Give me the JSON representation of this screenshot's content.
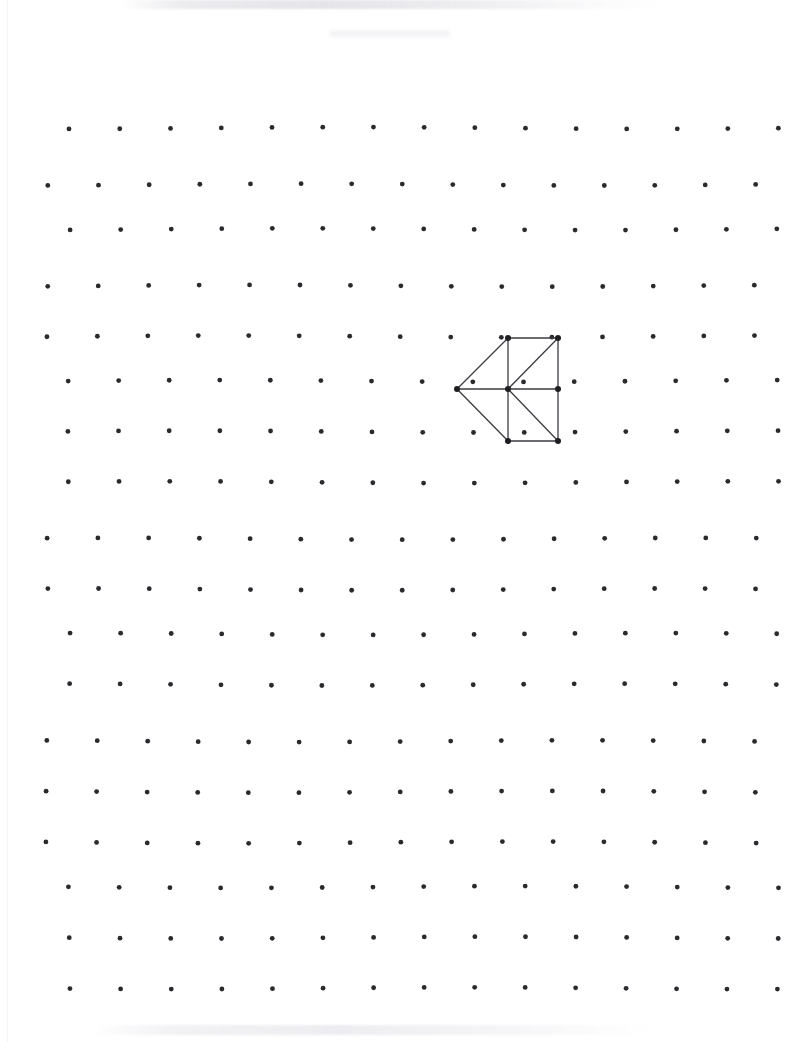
{
  "page": {
    "width": 787,
    "height": 1042,
    "background_color": "#ffffff",
    "medium": "scanned paper"
  },
  "grid": {
    "name": "dot-grid",
    "dot_color": "#2a2a2e",
    "dot_radius": 2.4,
    "columns": 15,
    "rows": 19,
    "spacing_x": 50.6,
    "spacing_y": 50.6,
    "origin_x": 47,
    "origin_y": 134,
    "skew_note": "scan wave distortion: alternating rows shift slightly right/up"
  },
  "figure": {
    "name": "arrowhead-polygon",
    "stroke_color": "#3c3c42",
    "stroke_width": 1.3,
    "vertex_color": "#1e1e22",
    "vertex_radius": 3.0,
    "grid_units": {
      "apex": [
        6,
        3.5
      ],
      "center": [
        7,
        3.5
      ],
      "top_left": [
        7,
        2.5
      ],
      "top_right": [
        8,
        2.5
      ],
      "mid_right": [
        8,
        3.5
      ],
      "bottom_left": [
        7,
        4.5
      ],
      "bottom_right": [
        8,
        4.5
      ]
    },
    "vertices": [
      {
        "id": "apex",
        "label": "A",
        "x": 457,
        "y": 389
      },
      {
        "id": "top_left",
        "label": "B",
        "x": 508,
        "y": 338
      },
      {
        "id": "top_right",
        "label": "C",
        "x": 558,
        "y": 338
      },
      {
        "id": "center",
        "label": "D",
        "x": 508,
        "y": 389
      },
      {
        "id": "mid_right",
        "label": "E",
        "x": 558,
        "y": 389
      },
      {
        "id": "bottom_left",
        "label": "F",
        "x": 508,
        "y": 441
      },
      {
        "id": "bottom_right",
        "label": "G",
        "x": 558,
        "y": 441
      }
    ],
    "edges": [
      {
        "from": "apex",
        "to": "top_left",
        "kind": "diagonal"
      },
      {
        "from": "apex",
        "to": "center",
        "kind": "horizontal"
      },
      {
        "from": "apex",
        "to": "bottom_left",
        "kind": "diagonal"
      },
      {
        "from": "top_left",
        "to": "top_right",
        "kind": "horizontal"
      },
      {
        "from": "top_left",
        "to": "center",
        "kind": "vertical"
      },
      {
        "from": "top_right",
        "to": "mid_right",
        "kind": "vertical"
      },
      {
        "from": "top_right",
        "to": "center",
        "kind": "diagonal"
      },
      {
        "from": "center",
        "to": "mid_right",
        "kind": "horizontal"
      },
      {
        "from": "center",
        "to": "bottom_left",
        "kind": "vertical"
      },
      {
        "from": "center",
        "to": "bottom_right",
        "kind": "diagonal"
      },
      {
        "from": "bottom_left",
        "to": "bottom_right",
        "kind": "horizontal"
      },
      {
        "from": "mid_right",
        "to": "bottom_right",
        "kind": "vertical"
      }
    ]
  },
  "artifacts": {
    "left_edge_line_color": "#f4f4f6",
    "top_smudge_present": true,
    "bottom_smudge_present": true
  }
}
